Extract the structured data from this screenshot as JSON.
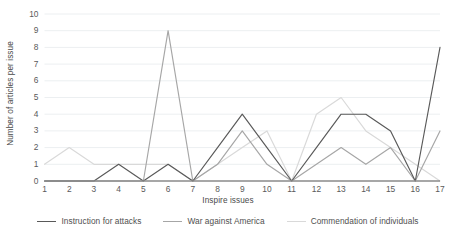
{
  "chart_data": {
    "type": "line",
    "title": "",
    "xlabel": "Inspire issues",
    "ylabel": "Number of articles per issue",
    "categories": [
      "1",
      "2",
      "3",
      "4",
      "5",
      "6",
      "7",
      "8",
      "9",
      "10",
      "11",
      "12",
      "13",
      "14",
      "15",
      "16",
      "17"
    ],
    "x": [
      1,
      2,
      3,
      4,
      5,
      6,
      7,
      8,
      9,
      10,
      11,
      12,
      13,
      14,
      15,
      16,
      17
    ],
    "ylim": [
      0,
      10
    ],
    "xlim": [
      1,
      17
    ],
    "yticks": [
      0,
      1,
      2,
      3,
      4,
      5,
      6,
      7,
      8,
      9,
      10
    ],
    "ytick_labels": [
      "0",
      "1",
      "2",
      "3",
      "4",
      "5",
      "6",
      "7",
      "8",
      "9",
      "10"
    ],
    "xtick_labels": [
      "1",
      "2",
      "3",
      "4",
      "5",
      "6",
      "7",
      "8",
      "9",
      "10",
      "11",
      "12",
      "13",
      "14",
      "15",
      "16",
      "17"
    ],
    "grid": "horizontal",
    "legend_position": "bottom",
    "series": [
      {
        "name": "Instruction for attacks",
        "color": "#595959",
        "values": [
          0,
          0,
          0,
          1,
          0,
          1,
          0,
          2,
          4,
          2,
          0,
          2,
          4,
          4,
          3,
          0,
          8
        ]
      },
      {
        "name": "War against America",
        "color": "#a6a6a6",
        "values": [
          0,
          0,
          0,
          0,
          0,
          9,
          0,
          1,
          3,
          1,
          0,
          1,
          2,
          1,
          2,
          0,
          3
        ]
      },
      {
        "name": "Commendation of individuals",
        "color": "#d9d9d9",
        "values": [
          1,
          2,
          1,
          1,
          1,
          1,
          0,
          1,
          2,
          3,
          0,
          4,
          5,
          3,
          2,
          1,
          0
        ]
      }
    ]
  },
  "axis": {
    "y_title": "Number of articles per issue",
    "x_title": "Inspire issues"
  },
  "legend": {
    "items": [
      {
        "label": "Instruction for attacks"
      },
      {
        "label": "War against America"
      },
      {
        "label": "Commendation of individuals"
      }
    ]
  }
}
